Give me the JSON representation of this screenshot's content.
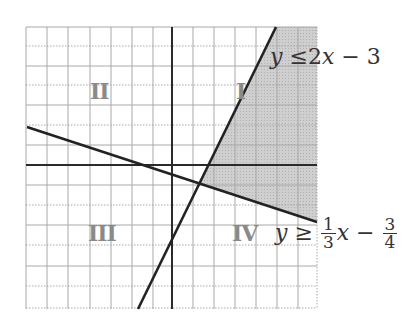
{
  "diagram": {
    "type": "coordinate-plane-inequality-graph",
    "quadrant_labels": {
      "q1": "I",
      "q2": "II",
      "q3": "III",
      "q4": "IV"
    },
    "inequalities": [
      {
        "id": "steep",
        "text_y": "y",
        "text_op": "≤",
        "text_rhs": "2x − 3",
        "rhs_coef": "2",
        "rhs_var": "x",
        "rhs_rest": " − 3",
        "slope": 2,
        "intercept": -3
      },
      {
        "id": "shallow",
        "text_y": "y",
        "text_op": "≥",
        "frac1_num": "1",
        "frac1_den": "3",
        "var": "x",
        "minus": " − ",
        "frac2_num": "3",
        "frac2_den": "4",
        "slope": 0.3333,
        "intercept": -0.75
      }
    ],
    "colors": {
      "grid": "#a0a0a0",
      "axis": "#2a2a2a",
      "line": "#222222",
      "shade": "#c8c8c8",
      "roman": "#8a8a8a"
    }
  }
}
